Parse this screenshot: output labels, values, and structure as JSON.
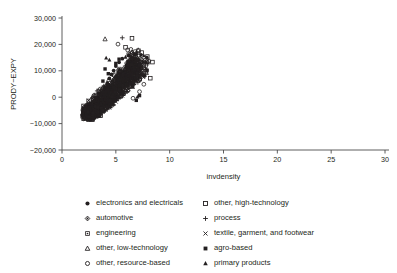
{
  "chart_data": {
    "type": "scatter",
    "title": "",
    "xlabel": "invdensity",
    "ylabel": "PRODY−EXPY",
    "xlim": [
      0,
      30
    ],
    "ylim": [
      -20000,
      30000
    ],
    "xticks": [
      0,
      5,
      10,
      15,
      20,
      25,
      30
    ],
    "xticklabels": [
      "0",
      "5",
      "10",
      "15",
      "20",
      "25",
      "30"
    ],
    "yticks": [
      -20000,
      -10000,
      0,
      10000,
      20000,
      30000
    ],
    "yticklabels": [
      "−20,000",
      "−10,000",
      "0",
      "10,000",
      "20,000",
      "30,000"
    ],
    "grid": false,
    "legend_position": "below",
    "marker_color": "#231f20",
    "series": [
      {
        "name": "electronics and electricals",
        "marker": "filled-circle",
        "points": [
          [
            2.4,
            -6200
          ],
          [
            2.6,
            -5400
          ],
          [
            2.7,
            -4100
          ],
          [
            2.9,
            -6800
          ],
          [
            3.0,
            -3200
          ],
          [
            3.1,
            -5000
          ],
          [
            3.2,
            -1800
          ],
          [
            3.3,
            -4400
          ],
          [
            3.4,
            -300
          ],
          [
            3.5,
            -2600
          ],
          [
            3.6,
            900
          ],
          [
            3.7,
            -4900
          ],
          [
            3.8,
            2100
          ],
          [
            3.9,
            -1200
          ],
          [
            4.0,
            3600
          ],
          [
            4.1,
            -3400
          ],
          [
            4.2,
            5200
          ],
          [
            4.3,
            400
          ],
          [
            4.4,
            7100
          ],
          [
            4.5,
            -2100
          ],
          [
            4.6,
            8600
          ],
          [
            4.7,
            2600
          ],
          [
            4.8,
            10100
          ],
          [
            4.9,
            -900
          ],
          [
            5.0,
            11800
          ],
          [
            5.1,
            4100
          ],
          [
            5.2,
            6300
          ],
          [
            5.3,
            13200
          ],
          [
            5.4,
            1600
          ],
          [
            5.5,
            9100
          ],
          [
            5.6,
            14600
          ],
          [
            5.8,
            7400
          ],
          [
            6.0,
            12100
          ],
          [
            6.2,
            15800
          ],
          [
            6.4,
            10400
          ],
          [
            6.6,
            13900
          ],
          [
            2.8,
            -7300
          ],
          [
            3.05,
            -6100
          ],
          [
            3.45,
            -5600
          ],
          [
            3.85,
            -4700
          ],
          [
            4.25,
            -3900
          ],
          [
            4.65,
            -1500
          ],
          [
            5.05,
            600
          ],
          [
            5.45,
            4700
          ],
          [
            5.85,
            8200
          ],
          [
            6.25,
            11200
          ],
          [
            6.8,
            16200
          ],
          [
            7.1,
            14200
          ]
        ]
      },
      {
        "name": "automotive",
        "marker": "diamond",
        "points": [
          [
            2.5,
            -5900
          ],
          [
            2.8,
            -4500
          ],
          [
            3.0,
            -6400
          ],
          [
            3.2,
            -3000
          ],
          [
            3.4,
            -4900
          ],
          [
            3.6,
            -1400
          ],
          [
            3.8,
            -3600
          ],
          [
            4.0,
            200
          ],
          [
            4.2,
            -2400
          ],
          [
            4.4,
            2300
          ],
          [
            4.6,
            -700
          ],
          [
            4.8,
            4800
          ],
          [
            5.0,
            1900
          ],
          [
            5.2,
            7200
          ],
          [
            5.4,
            3900
          ],
          [
            5.6,
            9600
          ],
          [
            5.9,
            6400
          ],
          [
            6.2,
            11900
          ],
          [
            6.5,
            8900
          ],
          [
            6.9,
            13400
          ],
          [
            7.3,
            11100
          ],
          [
            3.1,
            -7000
          ],
          [
            3.9,
            -5300
          ],
          [
            4.7,
            -1900
          ],
          [
            5.5,
            5600
          ],
          [
            6.1,
            10200
          ],
          [
            6.7,
            12600
          ]
        ]
      },
      {
        "name": "engineering",
        "marker": "asterisk-square",
        "points": [
          [
            2.6,
            -6600
          ],
          [
            2.9,
            -5100
          ],
          [
            3.1,
            -3800
          ],
          [
            3.3,
            -5800
          ],
          [
            3.5,
            -2200
          ],
          [
            3.7,
            -4300
          ],
          [
            3.9,
            -600
          ],
          [
            4.1,
            -2900
          ],
          [
            4.3,
            1400
          ],
          [
            4.5,
            -1100
          ],
          [
            4.7,
            3400
          ],
          [
            4.9,
            800
          ],
          [
            5.1,
            5900
          ],
          [
            5.3,
            2900
          ],
          [
            5.5,
            8100
          ],
          [
            5.7,
            5100
          ],
          [
            6.0,
            10600
          ],
          [
            6.3,
            7700
          ],
          [
            6.6,
            12800
          ],
          [
            7.0,
            10100
          ],
          [
            3.0,
            -7400
          ],
          [
            3.6,
            -6000
          ],
          [
            4.4,
            -3300
          ],
          [
            5.2,
            4300
          ],
          [
            5.9,
            9200
          ],
          [
            6.8,
            14100
          ]
        ]
      },
      {
        "name": "other, low-technology",
        "marker": "open-triangle",
        "points": [
          [
            4.0,
            22000
          ],
          [
            2.7,
            -5700
          ],
          [
            3.0,
            -4200
          ],
          [
            3.3,
            -6300
          ],
          [
            3.5,
            -2800
          ],
          [
            3.8,
            -4800
          ],
          [
            4.1,
            -1000
          ],
          [
            4.3,
            -3100
          ],
          [
            4.6,
            1800
          ],
          [
            4.8,
            -400
          ],
          [
            5.1,
            4200
          ],
          [
            5.3,
            1200
          ],
          [
            5.6,
            6800
          ],
          [
            5.9,
            3700
          ],
          [
            6.2,
            9900
          ],
          [
            6.6,
            7300
          ],
          [
            6.3,
            16400
          ],
          [
            6.5,
            17100
          ],
          [
            6.9,
            16800
          ],
          [
            7.2,
            12400
          ],
          [
            3.2,
            -7100
          ],
          [
            4.5,
            -2300
          ],
          [
            5.4,
            5400
          ],
          [
            6.0,
            11400
          ]
        ]
      },
      {
        "name": "other, resource-based",
        "marker": "open-circle",
        "points": [
          [
            5.2,
            20100
          ],
          [
            6.1,
            17900
          ],
          [
            6.4,
            18100
          ],
          [
            6.8,
            17300
          ],
          [
            2.8,
            -6100
          ],
          [
            3.1,
            -4600
          ],
          [
            3.4,
            -5900
          ],
          [
            3.6,
            -3400
          ],
          [
            3.9,
            -5200
          ],
          [
            4.2,
            -1600
          ],
          [
            4.4,
            -3700
          ],
          [
            4.7,
            900
          ],
          [
            4.9,
            -1300
          ],
          [
            5.2,
            3100
          ],
          [
            5.5,
            300
          ],
          [
            5.8,
            5800
          ],
          [
            6.1,
            2400
          ],
          [
            6.4,
            8400
          ],
          [
            6.7,
            5200
          ],
          [
            7.0,
            11600
          ],
          [
            7.4,
            9100
          ],
          [
            7.6,
            4900
          ],
          [
            6.6,
            -400
          ],
          [
            7.2,
            2100
          ],
          [
            3.3,
            -7200
          ],
          [
            4.0,
            -4100
          ],
          [
            5.0,
            1700
          ],
          [
            6.9,
            14900
          ]
        ]
      },
      {
        "name": "other, high-technology",
        "marker": "open-square",
        "points": [
          [
            6.5,
            22300
          ],
          [
            5.9,
            18900
          ],
          [
            6.2,
            16100
          ],
          [
            7.1,
            17600
          ],
          [
            7.4,
            16900
          ],
          [
            7.9,
            13400
          ],
          [
            8.4,
            13300
          ],
          [
            7.8,
            9800
          ],
          [
            8.2,
            7200
          ],
          [
            7.6,
            11200
          ],
          [
            2.9,
            -5500
          ],
          [
            3.2,
            -4000
          ],
          [
            3.5,
            -6200
          ],
          [
            3.7,
            -2700
          ],
          [
            4.0,
            -4400
          ],
          [
            4.3,
            -800
          ],
          [
            4.5,
            -3200
          ],
          [
            4.8,
            1100
          ],
          [
            5.1,
            -600
          ],
          [
            5.4,
            3600
          ],
          [
            5.7,
            1400
          ],
          [
            6.0,
            6900
          ],
          [
            6.3,
            4100
          ],
          [
            6.7,
            10300
          ],
          [
            7.0,
            7900
          ],
          [
            7.3,
            13100
          ],
          [
            3.6,
            -7000
          ],
          [
            4.6,
            -2000
          ],
          [
            5.6,
            8600
          ],
          [
            6.8,
            12200
          ]
        ]
      },
      {
        "name": "process",
        "marker": "plus",
        "points": [
          [
            5.6,
            22500
          ],
          [
            3.0,
            -5800
          ],
          [
            3.3,
            -4300
          ],
          [
            3.6,
            -5600
          ],
          [
            3.9,
            -3100
          ],
          [
            4.2,
            -4700
          ],
          [
            4.5,
            -1200
          ],
          [
            4.8,
            -2900
          ],
          [
            5.1,
            1600
          ],
          [
            5.4,
            -100
          ],
          [
            5.7,
            4600
          ],
          [
            6.0,
            2200
          ],
          [
            6.3,
            7600
          ],
          [
            6.6,
            5000
          ],
          [
            7.0,
            11000
          ],
          [
            7.3,
            8400
          ],
          [
            3.4,
            -6900
          ],
          [
            4.1,
            -3600
          ],
          [
            5.0,
            700
          ],
          [
            6.1,
            9700
          ]
        ]
      },
      {
        "name": "textile, garment, and footwear",
        "marker": "cross",
        "points": [
          [
            2.7,
            -6400
          ],
          [
            3.0,
            -5000
          ],
          [
            3.3,
            -6700
          ],
          [
            3.5,
            -3500
          ],
          [
            3.8,
            -5400
          ],
          [
            4.1,
            -2100
          ],
          [
            4.4,
            -4000
          ],
          [
            4.7,
            200
          ],
          [
            5.0,
            -1700
          ],
          [
            5.3,
            2800
          ],
          [
            5.6,
            600
          ],
          [
            5.9,
            5300
          ],
          [
            6.2,
            3000
          ],
          [
            6.5,
            8000
          ],
          [
            6.9,
            6100
          ],
          [
            3.1,
            -7300
          ],
          [
            4.0,
            -3800
          ],
          [
            4.9,
            1300
          ],
          [
            5.8,
            9400
          ],
          [
            6.4,
            10900
          ]
        ]
      },
      {
        "name": "agro-based",
        "marker": "filled-square",
        "points": [
          [
            4.0,
            10700
          ],
          [
            4.3,
            8900
          ],
          [
            3.8,
            6100
          ],
          [
            7.2,
            600
          ],
          [
            6.9,
            -1200
          ],
          [
            2.6,
            -5600
          ],
          [
            2.9,
            -4200
          ],
          [
            3.2,
            -6500
          ],
          [
            3.4,
            -2900
          ],
          [
            3.7,
            -4600
          ],
          [
            4.0,
            -1100
          ],
          [
            4.3,
            -3300
          ],
          [
            4.6,
            1500
          ],
          [
            4.9,
            -500
          ],
          [
            5.2,
            4400
          ],
          [
            5.5,
            2000
          ],
          [
            5.8,
            7000
          ],
          [
            6.1,
            4800
          ],
          [
            6.4,
            9800
          ],
          [
            6.7,
            7300
          ],
          [
            7.1,
            12300
          ],
          [
            3.5,
            -7100
          ],
          [
            4.4,
            -2600
          ],
          [
            5.4,
            6200
          ],
          [
            6.0,
            11500
          ],
          [
            5.0,
            12800
          ],
          [
            5.3,
            14400
          ]
        ]
      },
      {
        "name": "primary products",
        "marker": "filled-triangle",
        "points": [
          [
            4.1,
            14900
          ],
          [
            4.4,
            14100
          ],
          [
            6.6,
            3800
          ],
          [
            7.0,
            100
          ],
          [
            6.3,
            6600
          ],
          [
            2.8,
            -6300
          ],
          [
            3.1,
            -4900
          ],
          [
            3.4,
            -6100
          ],
          [
            3.6,
            -3300
          ],
          [
            3.9,
            -5100
          ],
          [
            4.2,
            -1800
          ],
          [
            4.5,
            -3600
          ],
          [
            4.8,
            800
          ],
          [
            5.1,
            -900
          ],
          [
            5.4,
            3300
          ],
          [
            5.7,
            1100
          ],
          [
            6.0,
            8200
          ],
          [
            6.4,
            12000
          ],
          [
            6.8,
            10500
          ],
          [
            3.3,
            -7200
          ],
          [
            4.7,
            -2400
          ],
          [
            5.6,
            5700
          ],
          [
            6.2,
            13600
          ],
          [
            5.9,
            15200
          ]
        ]
      }
    ]
  },
  "legend": {
    "columns": [
      [
        {
          "label": "electronics and electricals",
          "marker": "filled-circle"
        },
        {
          "label": "automotive",
          "marker": "diamond"
        },
        {
          "label": "engineering",
          "marker": "asterisk-square"
        },
        {
          "label": "other, low-technology",
          "marker": "open-triangle"
        },
        {
          "label": "other, resource-based",
          "marker": "open-circle"
        }
      ],
      [
        {
          "label": "other, high-technology",
          "marker": "open-square"
        },
        {
          "label": "process",
          "marker": "plus"
        },
        {
          "label": "textile, garment, and footwear",
          "marker": "cross"
        },
        {
          "label": "agro-based",
          "marker": "filled-square"
        },
        {
          "label": "primary products",
          "marker": "filled-triangle"
        }
      ]
    ]
  }
}
